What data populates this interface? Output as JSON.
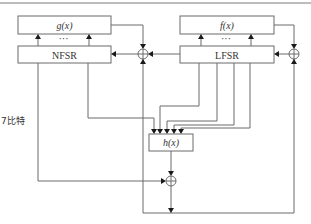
{
  "diagram": {
    "type": "stream-cipher-block-diagram",
    "blocks": {
      "g": {
        "label": "g(x)"
      },
      "nfsr": {
        "label": "NFSR"
      },
      "f": {
        "label": "f(x)"
      },
      "lfsr": {
        "label": "LFSR"
      },
      "h": {
        "label": "h(x)"
      }
    },
    "ellipsis": "···",
    "side_label": "7比特",
    "xor_nodes": [
      "nfsr-feedback-xor",
      "lfsr-feedback-xor",
      "output-xor"
    ],
    "colors": {
      "line": "#6b6b6b",
      "arrow": "#1a1a1a",
      "background": "#ffffff"
    }
  }
}
